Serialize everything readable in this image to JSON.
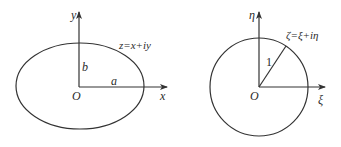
{
  "left_panel": {
    "shape": "ellipse",
    "y_axis_label": "y",
    "x_axis_label": "x",
    "origin_label": "O",
    "semi_major_label": "a",
    "semi_minor_label": "b",
    "plane_label": "z=x+iy"
  },
  "right_panel": {
    "shape": "unit-circle",
    "y_axis_label": "η",
    "x_axis_label": "ξ",
    "origin_label": "O",
    "radius_label": "1",
    "plane_label": "ζ=ξ+iη"
  },
  "colors": {
    "stroke": "#333333",
    "text": "#2a2a2a",
    "background": "#ffffff"
  }
}
